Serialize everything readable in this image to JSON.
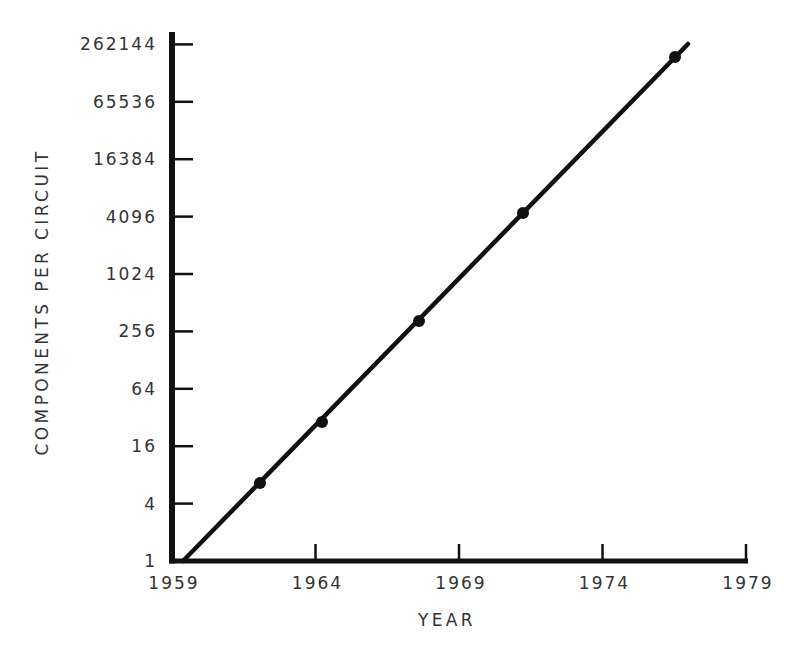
{
  "chart_data": {
    "type": "line",
    "title": "",
    "xlabel": "YEAR",
    "ylabel": "COMPONENTS PER CIRCUIT",
    "x_ticks": [
      "1959",
      "1964",
      "1969",
      "1974",
      "1979"
    ],
    "y_ticks": [
      "1",
      "4",
      "16",
      "64",
      "256",
      "1024",
      "4096",
      "16384",
      "65536",
      "262144"
    ],
    "y_scale": "log2 (ticks every factor of 4)",
    "xlim": [
      1959,
      1979
    ],
    "ylim": [
      1,
      262144
    ],
    "grid": false,
    "legend": null,
    "series": [
      {
        "name": "components per circuit",
        "style": "line with circular markers",
        "fit_line": {
          "start": {
            "x": 1959.4,
            "y": 1
          },
          "end": {
            "x": 1977,
            "y": 262144
          },
          "trend": "doubling every year"
        },
        "points": [
          {
            "x": 1962,
            "y": 8
          },
          {
            "x": 1964,
            "y": 32
          },
          {
            "x": 1967.6,
            "y": 300
          },
          {
            "x": 1971.2,
            "y": 4096
          },
          {
            "x": 1976.5,
            "y": 150000
          }
        ]
      }
    ]
  },
  "layout": {
    "plot": {
      "x0": 172,
      "x1": 747,
      "y0": 561,
      "y1": 44,
      "axis_top": 32
    },
    "px_per_year": 28.7,
    "px_per_factor4": 57.4,
    "line_color": "#111111"
  }
}
